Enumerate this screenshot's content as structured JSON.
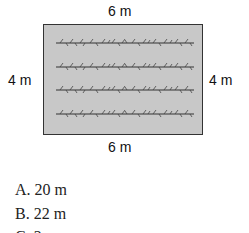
{
  "diagram": {
    "shape": "rectangle",
    "fill_color": "#c8c8c8",
    "border_color": "#333333",
    "labels": {
      "top": "6 m",
      "bottom": "6 m",
      "left": "4 m",
      "right": "4 m"
    },
    "plant_rows": 4,
    "plant_row_icon": "plant-row-icon"
  },
  "options": [
    {
      "letter": "A.",
      "text": "20 m"
    },
    {
      "letter": "B.",
      "text": "22 m"
    },
    {
      "letter": "C.",
      "text": "2…"
    }
  ]
}
